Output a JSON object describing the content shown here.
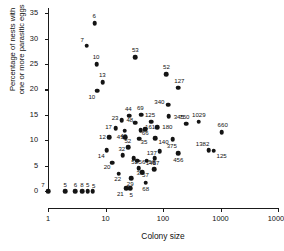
{
  "chart_data": {
    "type": "scatter",
    "title": "",
    "xlabel": "Colony size",
    "ylabel": "Percentage of nests with one or more parasitic eggs",
    "ylabel_line1": "Percentage of nests with",
    "ylabel_line2": "one or more parasitic eggs",
    "xscale": "log",
    "xlim": [
      1,
      10000
    ],
    "ylim": [
      0,
      36
    ],
    "grid": false,
    "legend": null,
    "xticks": [
      "1",
      "10",
      "100",
      "1000",
      "10000"
    ],
    "xtick_values": [
      1,
      10,
      100,
      1000,
      10000
    ],
    "yticks": [
      "0",
      "5",
      "10",
      "15",
      "20",
      "25",
      "30",
      "35"
    ],
    "ytick_values": [
      0,
      5,
      10,
      15,
      20,
      25,
      30,
      35
    ],
    "point_color": "#141414",
    "axis_color": "#1a1a1a",
    "points": [
      {
        "label": "6",
        "x": 6.5,
        "y": 33.0,
        "lx": -0.5,
        "ly": -7
      },
      {
        "label": "7",
        "x": 4.7,
        "y": 28.6,
        "lx": -4.5,
        "ly": -6
      },
      {
        "label": "10",
        "x": 7.0,
        "y": 25.0,
        "lx": -0.5,
        "ly": -7
      },
      {
        "label": "13",
        "x": 9.0,
        "y": 21.4,
        "lx": -0.5,
        "ly": -7
      },
      {
        "label": "10",
        "x": 7.2,
        "y": 19.7,
        "lx": -5.5,
        "ly": 6.5
      },
      {
        "label": "53",
        "x": 33.0,
        "y": 26.3,
        "lx": 0,
        "ly": -7
      },
      {
        "label": "52",
        "x": 115,
        "y": 23.0,
        "lx": 0,
        "ly": -7
      },
      {
        "label": "127",
        "x": 185,
        "y": 20.3,
        "lx": 1,
        "ly": -7
      },
      {
        "label": "340",
        "x": 124,
        "y": 17.0,
        "lx": -9,
        "ly": -3
      },
      {
        "label": "345",
        "x": 126,
        "y": 14.7,
        "lx": 10,
        "ly": 0.5
      },
      {
        "label": "750",
        "x": 255,
        "y": 13.2,
        "lx": -2,
        "ly": -6.5
      },
      {
        "label": "1029",
        "x": 420,
        "y": 13.6,
        "lx": 0,
        "ly": -7
      },
      {
        "label": "660",
        "x": 1050,
        "y": 11.6,
        "lx": 1,
        "ly": -7
      },
      {
        "label": "44",
        "x": 26,
        "y": 14.8,
        "lx": -1,
        "ly": -6.5
      },
      {
        "label": "69",
        "x": 42,
        "y": 15.0,
        "lx": -1,
        "ly": -6.5
      },
      {
        "label": "125",
        "x": 62,
        "y": 13.6,
        "lx": -1,
        "ly": -6.5
      },
      {
        "label": "23",
        "x": 19,
        "y": 13.9,
        "lx": -6.5,
        "ly": -2
      },
      {
        "label": "48",
        "x": 33,
        "y": 13.4,
        "lx": -5.5,
        "ly": -3
      },
      {
        "label": "180",
        "x": 80,
        "y": 12.5,
        "lx": 10,
        "ly": 0
      },
      {
        "label": "17",
        "x": 15,
        "y": 12.4,
        "lx": -7,
        "ly": -0.5
      },
      {
        "label": "40",
        "x": 21.5,
        "y": 11.9,
        "lx": -1,
        "ly": 5.5
      },
      {
        "label": "66",
        "x": 41,
        "y": 12.0,
        "lx": 4.5,
        "ly": 2.5
      },
      {
        "label": "161",
        "x": 49,
        "y": 12.1,
        "lx": 5,
        "ly": -2.5
      },
      {
        "label": "12",
        "x": 11.5,
        "y": 10.6,
        "lx": -6.5,
        "ly": -0.5
      },
      {
        "label": "41",
        "x": 22,
        "y": 10.6,
        "lx": -5,
        "ly": -0.5
      },
      {
        "label": "35",
        "x": 39,
        "y": 10.3,
        "lx": 4.5,
        "ly": 3.5
      },
      {
        "label": "140",
        "x": 74,
        "y": 10.4,
        "lx": 8,
        "ly": 3.5
      },
      {
        "label": "375",
        "x": 148,
        "y": 10.2,
        "lx": -1,
        "ly": 6.5
      },
      {
        "label": "1382",
        "x": 620,
        "y": 8.0,
        "lx": -6,
        "ly": -6.5
      },
      {
        "label": "125",
        "x": 760,
        "y": 7.9,
        "lx": 8,
        "ly": 5
      },
      {
        "label": "14",
        "x": 10.5,
        "y": 8.0,
        "lx": -5.5,
        "ly": 5.5
      },
      {
        "label": "52",
        "x": 25,
        "y": 8.6,
        "lx": -0.5,
        "ly": -6
      },
      {
        "label": "137",
        "x": 88,
        "y": 7.8,
        "lx": -8,
        "ly": 1.5
      },
      {
        "label": "456",
        "x": 184,
        "y": 7.4,
        "lx": 0,
        "ly": 6.5
      },
      {
        "label": "32",
        "x": 20,
        "y": 7.0,
        "lx": -1,
        "ly": -6
      },
      {
        "label": "52",
        "x": 31,
        "y": 6.5,
        "lx": 1,
        "ly": 4.5
      },
      {
        "label": "20",
        "x": 13,
        "y": 5.6,
        "lx": -5,
        "ly": 4
      },
      {
        "label": "56",
        "x": 36,
        "y": 6.0,
        "lx": 4.5,
        "ly": 1.5
      },
      {
        "label": "56",
        "x": 52,
        "y": 6.0,
        "lx": 5,
        "ly": 1.5
      },
      {
        "label": "140",
        "x": 72,
        "y": 6.5,
        "lx": -4,
        "ly": 5.5
      },
      {
        "label": "33",
        "x": 38,
        "y": 4.5,
        "lx": 1,
        "ly": 4.5
      },
      {
        "label": "57",
        "x": 44,
        "y": 3.7,
        "lx": 3,
        "ly": 3
      },
      {
        "label": "57",
        "x": 70,
        "y": 4.3,
        "lx": 2,
        "ly": -6
      },
      {
        "label": "22",
        "x": 17,
        "y": 3.4,
        "lx": -1,
        "ly": 5.5
      },
      {
        "label": "29",
        "x": 28,
        "y": 2.5,
        "lx": -1,
        "ly": 5.5
      },
      {
        "label": "68",
        "x": 50,
        "y": 1.6,
        "lx": 0,
        "ly": 6.5
      },
      {
        "label": "21",
        "x": 23,
        "y": 0.5,
        "lx": -6,
        "ly": 5.5
      },
      {
        "label": "5",
        "x": 27,
        "y": 0.5,
        "lx": 1,
        "ly": 7
      },
      {
        "label": "7",
        "x": 1.0,
        "y": 0.0,
        "lx": -5,
        "ly": -6.5
      },
      {
        "label": "5",
        "x": 2.0,
        "y": 0.0,
        "lx": 0,
        "ly": -6.5
      },
      {
        "label": "6",
        "x": 3.0,
        "y": 0.0,
        "lx": 0,
        "ly": -6.5
      },
      {
        "label": "8",
        "x": 3.9,
        "y": 0.0,
        "lx": 0,
        "ly": -6.5
      },
      {
        "label": "5",
        "x": 4.9,
        "y": 0.0,
        "lx": 0,
        "ly": -6.5
      },
      {
        "label": "5",
        "x": 6.0,
        "y": 0.0,
        "lx": 1,
        "ly": -5.5
      }
    ]
  }
}
